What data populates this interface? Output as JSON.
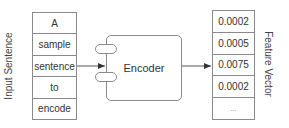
{
  "input": {
    "label": "Input Sentence",
    "tokens": [
      "A",
      "sample",
      "sentence",
      "to",
      "encode"
    ]
  },
  "encoder": {
    "label": "Encoder"
  },
  "output": {
    "label": "Feature Vector",
    "values": [
      "0.0002",
      "0.0005",
      "0.0075",
      "0.0002",
      "..."
    ]
  },
  "colors": {
    "stroke": "#8a8a8a",
    "arrow": "#333333",
    "text": "#333333"
  }
}
